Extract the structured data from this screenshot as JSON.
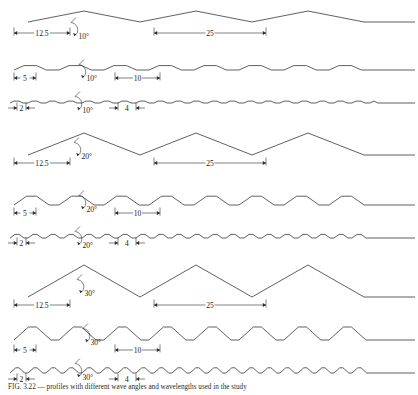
{
  "figure": {
    "stroke_color": "#2b2b2b",
    "background_color": "#ffffff",
    "rows": [
      {
        "id": "row-1",
        "angle_label": "10°",
        "angle_deg": 10,
        "half_wavelength_label": "12.5",
        "half_wavelength": 12.5,
        "wavelength_label": "25",
        "wavelength": 25,
        "baseline_y": 22,
        "amplitude": 11,
        "period_px": 112,
        "start_x": 28,
        "end_x": 415,
        "phase_shift": 0,
        "flat_frac": 0.0,
        "dim_small_y": 33,
        "dim_large_y": 33,
        "dim_small_x1": 14,
        "dim_small_x2": 70,
        "dim_large_x1": 154,
        "dim_large_x2": 266,
        "dim_small_inside": true,
        "dim_large_inside": true,
        "angle_x": 72,
        "angle_y": 30
      },
      {
        "id": "row-2",
        "angle_label": "10°",
        "angle_deg": 10,
        "half_wavelength_label": "5",
        "half_wavelength": 5,
        "wavelength_label": "10",
        "wavelength": 10,
        "baseline_y": 70,
        "amplitude": 4.4,
        "period_px": 45,
        "start_x": 14,
        "end_x": 415,
        "phase_shift": 0,
        "flat_frac": 0.28,
        "dim_small_y": 78,
        "dim_large_y": 78,
        "dim_small_x1": 14,
        "dim_small_x2": 36,
        "dim_large_x1": 115,
        "dim_large_x2": 160,
        "dim_small_inside": true,
        "dim_large_inside": true,
        "angle_x": 80,
        "angle_y": 72
      },
      {
        "id": "row-3",
        "angle_label": "10°",
        "angle_deg": 10,
        "half_wavelength_label": "2",
        "half_wavelength": 2,
        "wavelength_label": "4",
        "wavelength": 4,
        "baseline_y": 103,
        "amplitude": 1.9,
        "period_px": 18,
        "start_x": 10,
        "end_x": 415,
        "phase_shift": 0,
        "flat_frac": 0.28,
        "dim_small_y": 108,
        "dim_large_y": 108,
        "dim_small_x1": 17,
        "dim_small_x2": 26,
        "dim_large_x1": 118,
        "dim_large_x2": 136,
        "dim_small_inside": false,
        "dim_large_inside": false,
        "angle_x": 76,
        "angle_y": 104
      },
      {
        "id": "row-4",
        "angle_label": "20°",
        "angle_deg": 20,
        "half_wavelength_label": "12.5",
        "half_wavelength": 12.5,
        "wavelength_label": "25",
        "wavelength": 25,
        "baseline_y": 155,
        "amplitude": 22,
        "period_px": 112,
        "start_x": 28,
        "end_x": 415,
        "phase_shift": 0,
        "flat_frac": 0.0,
        "dim_small_y": 163,
        "dim_large_y": 163,
        "dim_small_x1": 14,
        "dim_small_x2": 70,
        "dim_large_x1": 154,
        "dim_large_x2": 266,
        "dim_small_inside": true,
        "dim_large_inside": true,
        "angle_x": 75,
        "angle_y": 150
      },
      {
        "id": "row-5",
        "angle_label": "20°",
        "angle_deg": 20,
        "half_wavelength_label": "5",
        "half_wavelength": 5,
        "wavelength_label": "10",
        "wavelength": 10,
        "baseline_y": 205,
        "amplitude": 8.8,
        "period_px": 45,
        "start_x": 14,
        "end_x": 415,
        "phase_shift": 0,
        "flat_frac": 0.22,
        "dim_small_y": 213,
        "dim_large_y": 213,
        "dim_small_x1": 14,
        "dim_small_x2": 36,
        "dim_large_x1": 115,
        "dim_large_x2": 160,
        "dim_small_inside": true,
        "dim_large_inside": true,
        "angle_x": 80,
        "angle_y": 203
      },
      {
        "id": "row-6",
        "angle_label": "20°",
        "angle_deg": 20,
        "half_wavelength_label": "2",
        "half_wavelength": 2,
        "wavelength_label": "4",
        "wavelength": 4,
        "baseline_y": 238,
        "amplitude": 3.6,
        "period_px": 18,
        "start_x": 10,
        "end_x": 415,
        "phase_shift": 0,
        "flat_frac": 0.22,
        "dim_small_y": 243,
        "dim_large_y": 243,
        "dim_small_x1": 17,
        "dim_small_x2": 26,
        "dim_large_x1": 118,
        "dim_large_x2": 136,
        "dim_small_inside": false,
        "dim_large_inside": false,
        "angle_x": 76,
        "angle_y": 239
      },
      {
        "id": "row-7",
        "angle_label": "30°",
        "angle_deg": 30,
        "half_wavelength_label": "12.5",
        "half_wavelength": 12.5,
        "wavelength_label": "25",
        "wavelength": 25,
        "baseline_y": 297,
        "amplitude": 32,
        "period_px": 112,
        "start_x": 28,
        "end_x": 415,
        "phase_shift": 0,
        "flat_frac": 0.0,
        "dim_small_y": 305,
        "dim_large_y": 305,
        "dim_small_x1": 14,
        "dim_small_x2": 70,
        "dim_large_x1": 154,
        "dim_large_x2": 266,
        "dim_small_inside": true,
        "dim_large_inside": true,
        "angle_x": 78,
        "angle_y": 287
      },
      {
        "id": "row-8",
        "angle_label": "30°",
        "angle_deg": 30,
        "half_wavelength_label": "5",
        "half_wavelength": 5,
        "wavelength_label": "10",
        "wavelength": 10,
        "baseline_y": 340,
        "amplitude": 13,
        "period_px": 45,
        "start_x": 14,
        "end_x": 415,
        "phase_shift": 0,
        "flat_frac": 0.18,
        "dim_small_y": 350,
        "dim_large_y": 350,
        "dim_small_x1": 14,
        "dim_small_x2": 36,
        "dim_large_x1": 115,
        "dim_large_x2": 160,
        "dim_small_inside": true,
        "dim_large_inside": true,
        "angle_x": 84,
        "angle_y": 336
      },
      {
        "id": "row-9",
        "angle_label": "30°",
        "angle_deg": 30,
        "half_wavelength_label": "2",
        "half_wavelength": 2,
        "wavelength_label": "4",
        "wavelength": 4,
        "baseline_y": 373,
        "amplitude": 5.2,
        "period_px": 18,
        "start_x": 10,
        "end_x": 415,
        "phase_shift": 0,
        "flat_frac": 0.18,
        "dim_small_y": 379,
        "dim_large_y": 379,
        "dim_small_x1": 17,
        "dim_small_x2": 26,
        "dim_large_x1": 118,
        "dim_large_x2": 136,
        "dim_small_inside": false,
        "dim_large_inside": false,
        "angle_x": 76,
        "angle_y": 371
      }
    ]
  },
  "caption": {
    "text": "FIG. 3.22   — profiles with different wave angles and wavelengths used in the study"
  },
  "chart_data": {
    "type": "line",
    "xlabel": "",
    "ylabel": "",
    "series": [
      {
        "name": "10°, wavelength 25 (half 12.5)",
        "angle_deg": 10,
        "wavelength": 25,
        "half_wavelength": 12.5
      },
      {
        "name": "10°, wavelength 10 (half 5)",
        "angle_deg": 10,
        "wavelength": 10,
        "half_wavelength": 5
      },
      {
        "name": "10°, wavelength 4 (half 2)",
        "angle_deg": 10,
        "wavelength": 4,
        "half_wavelength": 2
      },
      {
        "name": "20°, wavelength 25 (half 12.5)",
        "angle_deg": 20,
        "wavelength": 25,
        "half_wavelength": 12.5
      },
      {
        "name": "20°, wavelength 10 (half 5)",
        "angle_deg": 20,
        "wavelength": 10,
        "half_wavelength": 5
      },
      {
        "name": "20°, wavelength 4 (half 2)",
        "angle_deg": 20,
        "wavelength": 4,
        "half_wavelength": 2
      },
      {
        "name": "30°, wavelength 25 (half 12.5)",
        "angle_deg": 30,
        "wavelength": 25,
        "half_wavelength": 12.5
      },
      {
        "name": "30°, wavelength 10 (half 5)",
        "angle_deg": 30,
        "wavelength": 10,
        "half_wavelength": 5
      },
      {
        "name": "30°, wavelength 4 (half 2)",
        "angle_deg": 30,
        "wavelength": 4,
        "half_wavelength": 2
      }
    ],
    "angle_labels": [
      "10°",
      "20°",
      "30°"
    ],
    "wavelength_labels": [
      "25",
      "10",
      "4"
    ],
    "half_wavelength_labels": [
      "12.5",
      "5",
      "2"
    ],
    "grid": false,
    "legend": "none"
  }
}
